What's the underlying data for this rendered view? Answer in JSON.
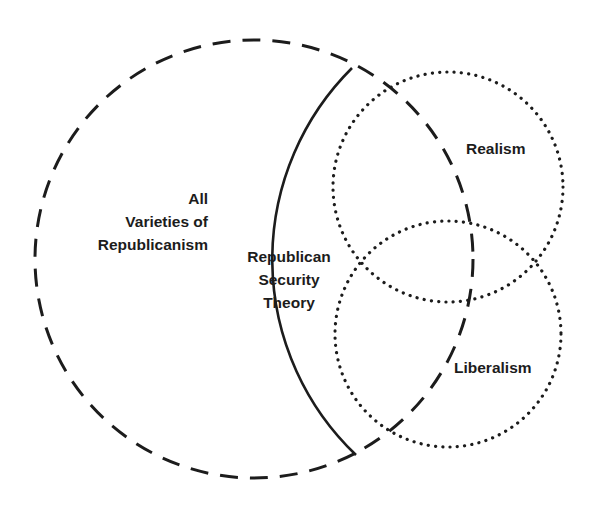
{
  "diagram": {
    "type": "venn",
    "sets": [
      {
        "id": "all_republicanism",
        "label_lines": [
          "All",
          "Varieties of",
          "Republicanism"
        ],
        "line_style": "dashed",
        "color": "#1c1c1c"
      },
      {
        "id": "republican_security_theory",
        "label_lines": [
          "Republican",
          "Security",
          "Theory"
        ],
        "line_style": "solid",
        "color": "#1c1c1c"
      },
      {
        "id": "realism",
        "label": "Realism",
        "line_style": "dotted",
        "color": "#1c1c1c"
      },
      {
        "id": "liberalism",
        "label": "Liberalism",
        "line_style": "dotted",
        "color": "#1c1c1c"
      }
    ],
    "relationships": [
      "Republican Security Theory is a subset of All Varieties of Republicanism",
      "Republican Security Theory overlaps Realism and Liberalism",
      "Realism and Liberalism overlap each other"
    ]
  },
  "labels": {
    "all": "All",
    "varieties": "Varieties of",
    "republicanism": "Republicanism",
    "rst_1": "Republican",
    "rst_2": "Security",
    "rst_3": "Theory",
    "realism": "Realism",
    "liberalism": "Liberalism"
  },
  "colors": {
    "stroke": "#1c1c1c",
    "background": "#ffffff"
  }
}
